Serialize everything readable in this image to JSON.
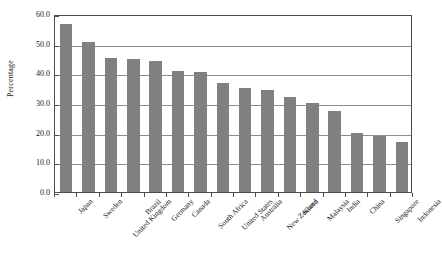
{
  "chart_data": {
    "type": "bar",
    "title": "",
    "subtitle": "",
    "xlabel": "",
    "ylabel": "Percentage",
    "ylim": [
      0,
      60
    ],
    "ytick_labels": [
      "60.0",
      "50.0",
      "40.0",
      "30.0",
      "20.0",
      "10.0",
      "0.0"
    ],
    "ytick_values": [
      60,
      50,
      40,
      30,
      20,
      10,
      0
    ],
    "grid": true,
    "legend": false,
    "legend_position": "none",
    "bar_color": "#808080",
    "frame_color": "#4d4d4d",
    "gridline_color": "#8c8c8c",
    "background_color": "#ffffff",
    "categories": [
      "Japan",
      "Sweden",
      "United Kingdom",
      "Brazil",
      "Germany",
      "Canada",
      "South Africa",
      "United States",
      "Australia",
      "New Zealand",
      "Korea",
      "Malaysia",
      "India",
      "China",
      "Singapore",
      "Indonesia"
    ],
    "values": [
      56.6,
      50.6,
      45.3,
      44.8,
      44.3,
      40.8,
      40.3,
      36.8,
      34.9,
      34.3,
      32.0,
      29.9,
      27.4,
      20.0,
      19.0,
      16.7
    ]
  }
}
